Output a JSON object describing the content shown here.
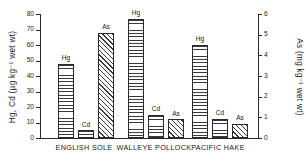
{
  "chart_data": {
    "type": "bar",
    "title": "",
    "categories": [
      "ENGLISH SOLE",
      "WALLEYE POLLOCK",
      "PACIFIC HAKE"
    ],
    "series": [
      {
        "name": "Hg",
        "axis": "left",
        "unit": "µg kg⁻¹ wet wt",
        "values": [
          48,
          77,
          60
        ]
      },
      {
        "name": "Cd",
        "axis": "left",
        "unit": "µg kg⁻¹ wet wt",
        "values": [
          5,
          15,
          12.5
        ]
      },
      {
        "name": "As",
        "axis": "right",
        "unit": "mg kg⁻¹ wet wt",
        "values": [
          5.1,
          0.9,
          0.7
        ]
      }
    ],
    "ylabel": "Hg, Cd (µg kg⁻¹ wet wt)",
    "ylabel_right": "As (mg kg⁻¹ wet wt)",
    "xlabel": "",
    "ylim": [
      0,
      80
    ],
    "ylim_right": [
      0,
      6
    ],
    "yticks": [
      0,
      10,
      20,
      30,
      40,
      50,
      60,
      70,
      80
    ],
    "yticks_right": [
      0,
      1,
      2,
      3,
      4,
      5,
      6
    ],
    "grid": false,
    "legend": "none",
    "bar_labels": [
      [
        "Hg",
        "Cd",
        "As"
      ],
      [
        "Hg",
        "Cd",
        "As"
      ],
      [
        "Hg",
        "Cd",
        "As"
      ]
    ]
  },
  "axes": {
    "left_title": "Hg, Cd (µg kg⁻¹ wet wt)",
    "right_title": "As (mg kg⁻¹ wet wt)",
    "left_ticks": [
      "0",
      "10",
      "20",
      "30",
      "40",
      "50",
      "60",
      "70",
      "80"
    ],
    "right_ticks": [
      "0",
      "1",
      "2",
      "3",
      "4",
      "5",
      "6"
    ]
  },
  "categories": {
    "c0": "ENGLISH SOLE",
    "c1": "WALLEYE POLLOCK",
    "c2": "PACIFIC HAKE"
  },
  "labels": {
    "hg": "Hg",
    "cd": "Cd",
    "as": "As"
  }
}
